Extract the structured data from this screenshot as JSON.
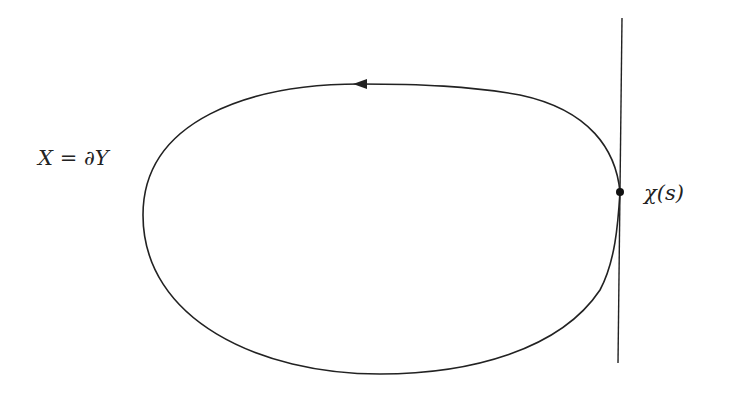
{
  "diagram": {
    "curve_label": "X = ∂Y",
    "point_label": "χ(s)",
    "elements": {
      "curve": "closed oriented curve (counterclockwise arrow on top)",
      "tangent_line": "vertical tangent line touching curve at the point",
      "point": "marked point on curve"
    },
    "colors": {
      "stroke": "#222222",
      "background": "#ffffff"
    }
  }
}
